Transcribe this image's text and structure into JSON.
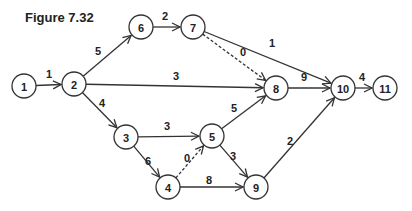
{
  "title": "Figure 7.32",
  "nodes": [
    {
      "id": "1",
      "x": 24,
      "y": 86
    },
    {
      "id": "2",
      "x": 74,
      "y": 84
    },
    {
      "id": "3",
      "x": 126,
      "y": 137
    },
    {
      "id": "4",
      "x": 168,
      "y": 187
    },
    {
      "id": "5",
      "x": 212,
      "y": 136
    },
    {
      "id": "6",
      "x": 141,
      "y": 27
    },
    {
      "id": "7",
      "x": 193,
      "y": 27
    },
    {
      "id": "8",
      "x": 276,
      "y": 88
    },
    {
      "id": "9",
      "x": 256,
      "y": 187
    },
    {
      "id": "10",
      "x": 343,
      "y": 88
    },
    {
      "id": "11",
      "x": 385,
      "y": 88
    }
  ],
  "edges": [
    {
      "from": "1",
      "to": "2",
      "weight": "1",
      "dashed": false,
      "lx": 49,
      "ly": 78
    },
    {
      "from": "2",
      "to": "6",
      "weight": "5",
      "dashed": false,
      "lx": 98,
      "ly": 55
    },
    {
      "from": "2",
      "to": "8",
      "weight": "3",
      "dashed": false,
      "lx": 176,
      "ly": 80
    },
    {
      "from": "2",
      "to": "3",
      "weight": "4",
      "dashed": false,
      "lx": 102,
      "ly": 107
    },
    {
      "from": "6",
      "to": "7",
      "weight": "2",
      "dashed": false,
      "lx": 165,
      "ly": 20
    },
    {
      "from": "7",
      "to": "8",
      "weight": "0",
      "dashed": true,
      "lx": 243,
      "ly": 56
    },
    {
      "from": "7",
      "to": "10",
      "weight": "1",
      "dashed": false,
      "lx": 272,
      "ly": 47
    },
    {
      "from": "8",
      "to": "10",
      "weight": "9",
      "dashed": false,
      "lx": 304,
      "ly": 81
    },
    {
      "from": "10",
      "to": "11",
      "weight": "4",
      "dashed": false,
      "lx": 362,
      "ly": 81
    },
    {
      "from": "3",
      "to": "5",
      "weight": "3",
      "dashed": false,
      "lx": 167,
      "ly": 130
    },
    {
      "from": "3",
      "to": "4",
      "weight": "6",
      "dashed": false,
      "lx": 148,
      "ly": 165
    },
    {
      "from": "4",
      "to": "5",
      "weight": "0",
      "dashed": true,
      "lx": 187,
      "ly": 162
    },
    {
      "from": "4",
      "to": "9",
      "weight": "8",
      "dashed": false,
      "lx": 209,
      "ly": 184
    },
    {
      "from": "5",
      "to": "8",
      "weight": "5",
      "dashed": false,
      "lx": 234,
      "ly": 112
    },
    {
      "from": "5",
      "to": "9",
      "weight": "3",
      "dashed": false,
      "lx": 233,
      "ly": 160
    },
    {
      "from": "9",
      "to": "10",
      "weight": "2",
      "dashed": false,
      "lx": 290,
      "ly": 145
    }
  ]
}
